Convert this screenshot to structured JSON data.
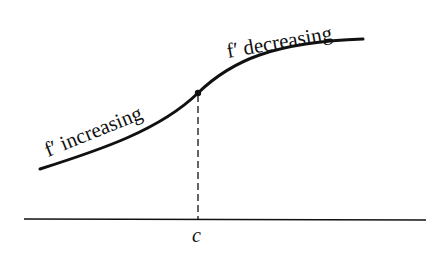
{
  "figure": {
    "labels": {
      "left_curve": "f′ increasing",
      "right_curve": "f′ decreasing",
      "axis_point": "c"
    },
    "inflection_point": {
      "x": 198,
      "y": 93
    },
    "colors": {
      "ink": "#111111",
      "background": "#ffffff"
    }
  }
}
